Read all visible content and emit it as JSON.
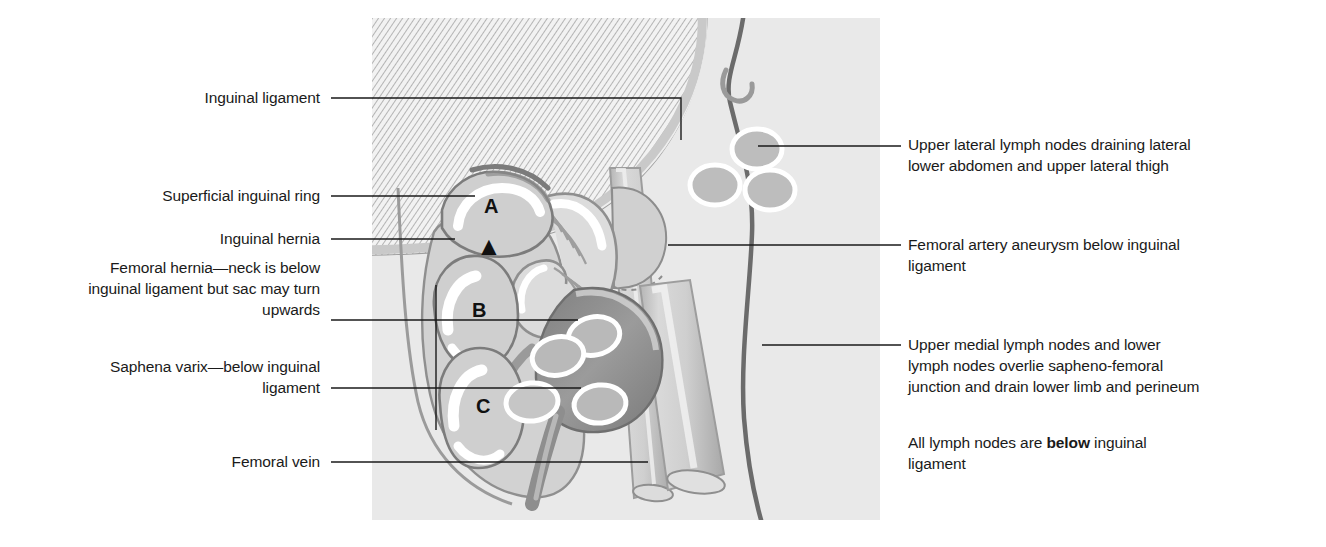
{
  "figure": {
    "type": "anatomical-diagram",
    "background_color": "#ffffff",
    "panel_color": "#eeeeee"
  },
  "labels": {
    "left": [
      {
        "id": "inguinal-ligament",
        "text": "Inguinal ligament"
      },
      {
        "id": "superficial-inguinal-ring",
        "text": "Superficial inguinal ring"
      },
      {
        "id": "inguinal-hernia",
        "text": "Inguinal hernia"
      },
      {
        "id": "femoral-hernia",
        "text": "Femoral hernia—neck is below\ninguinal ligament but sac may turn\nupwards"
      },
      {
        "id": "saphena-varix",
        "text": "Saphena varix—below inguinal\nligament"
      },
      {
        "id": "femoral-vein",
        "text": "Femoral vein"
      }
    ],
    "right": [
      {
        "id": "upper-lateral-lymph-nodes",
        "text": "Upper lateral lymph nodes draining lateral\nlower abdomen and upper lateral thigh"
      },
      {
        "id": "femoral-artery-aneurysm",
        "text": "Femoral artery aneurysm below inguinal\nligament"
      },
      {
        "id": "upper-medial-lymph-nodes",
        "text": "Upper medial lymph nodes and lower\nlymph nodes overlie sapheno-femoral\njunction and drain lower limb and perineum"
      }
    ],
    "note": {
      "id": "lymph-node-note",
      "prefix": "All lymph nodes are ",
      "emphasis": "below",
      "suffix": " inguinal\nligament"
    }
  },
  "markers": {
    "a": "A",
    "b": "B",
    "c": "C",
    "arrow": "▲"
  },
  "structures": {
    "inguinal_ligament": "external oblique aponeurosis, hatched",
    "hernia_sacs": [
      "A",
      "B",
      "C"
    ],
    "femoral_artery": "femoral artery with aneurysmal bulge",
    "femoral_vein": "femoral vein",
    "saphena_varix": "dilated sapheno-femoral junction",
    "lymph_nodes_upper_lateral_count": 3,
    "lymph_nodes_medial_count": 4
  },
  "colors": {
    "ink": "#1a1a1a",
    "panel": "#eeeeee",
    "tissue_light": "#d6d6d6",
    "tissue_mid": "#c2c2c2",
    "tissue_dark": "#9a9a9a",
    "vessel_dark": "#8d8d8d",
    "varix_dark": "#8a8a8a",
    "outline": "#6e6e6e",
    "highlight": "#ffffff"
  }
}
